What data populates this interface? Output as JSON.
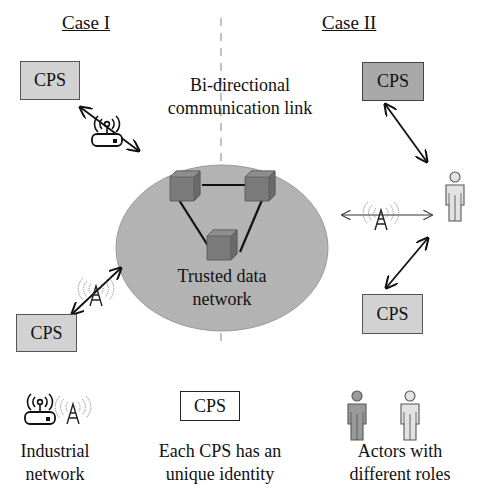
{
  "case_left": {
    "title": "Case I"
  },
  "case_right": {
    "title": "Case II"
  },
  "link_label": {
    "line1": "Bi-directional",
    "line2": "communication link"
  },
  "network": {
    "line1": "Trusted data",
    "line2": "network",
    "fill": "#b3b3b3"
  },
  "cps_boxes": [
    {
      "label": "CPS",
      "position": "case1-top"
    },
    {
      "label": "CPS",
      "position": "case1-bottom"
    },
    {
      "label": "CPS",
      "position": "case2-top"
    },
    {
      "label": "CPS",
      "position": "case2-bottom"
    }
  ],
  "legend": {
    "industrial": {
      "line1": "Industrial",
      "line2": "network"
    },
    "cps": {
      "box": "CPS",
      "line1": "Each CPS has an",
      "line2": "unique identity"
    },
    "actors": {
      "line1": "Actors with",
      "line2": "different roles"
    }
  },
  "colors": {
    "cube": "#7a7a7a",
    "cps_fill": "#d2d2d2",
    "cps_dark": "#a9a9a9",
    "actor_dark": "#9a9a9a",
    "actor_light": "#e2e2e2"
  }
}
